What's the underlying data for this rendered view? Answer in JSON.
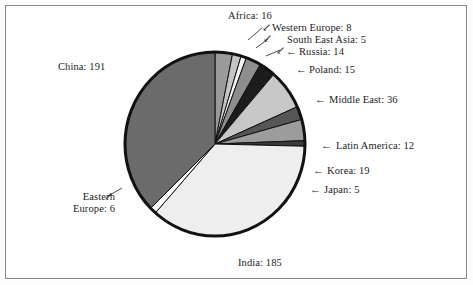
{
  "chart_data": {
    "type": "pie",
    "title": "",
    "subtitle": "",
    "xlabel": "",
    "ylabel": "",
    "legend_position": "none",
    "grid": false,
    "total": 512,
    "label_format": "name: value",
    "categories": [
      "Africa",
      "Western Europe",
      "South East Asia",
      "Russia",
      "Poland",
      "Middle East",
      "Latin America",
      "Korea",
      "Japan",
      "India",
      "Eastern Europe",
      "China"
    ],
    "values": [
      16,
      8,
      5,
      14,
      15,
      36,
      12,
      19,
      5,
      185,
      6,
      191
    ],
    "slices": [
      {
        "name": "Africa",
        "value": 16,
        "label": "Africa: 16",
        "color": "#9a9a9a",
        "start_deg": 0.0,
        "end_deg": 11.25
      },
      {
        "name": "Western Europe",
        "value": 8,
        "label": "Western Europe: 8",
        "color": "#c4c4c4",
        "start_deg": 11.25,
        "end_deg": 16.88
      },
      {
        "name": "South East Asia",
        "value": 5,
        "label": "South East Asia: 5",
        "color": "#f2f2f2",
        "start_deg": 16.88,
        "end_deg": 20.39
      },
      {
        "name": "Russia",
        "value": 14,
        "label": "Russia: 14",
        "color": "#8d8d8d",
        "start_deg": 20.39,
        "end_deg": 30.23
      },
      {
        "name": "Poland",
        "value": 15,
        "label": "Poland: 15",
        "color": "#1c1c1c",
        "start_deg": 30.23,
        "end_deg": 40.78
      },
      {
        "name": "Middle East",
        "value": 36,
        "label": "Middle East: 36",
        "color": "#c8c8c8",
        "start_deg": 40.78,
        "end_deg": 66.09
      },
      {
        "name": "Latin America",
        "value": 12,
        "label": "Latin America: 12",
        "color": "#565656",
        "start_deg": 66.09,
        "end_deg": 74.53
      },
      {
        "name": "Korea",
        "value": 19,
        "label": "Korea: 19",
        "color": "#9c9c9c",
        "start_deg": 74.53,
        "end_deg": 87.89
      },
      {
        "name": "Japan",
        "value": 5,
        "label": "Japan: 5",
        "color": "#3a3a3a",
        "start_deg": 87.89,
        "end_deg": 91.41
      },
      {
        "name": "India",
        "value": 185,
        "label": "India: 185",
        "color": "#eeeeee",
        "start_deg": 91.41,
        "end_deg": 221.48
      },
      {
        "name": "Eastern Europe",
        "value": 6,
        "label": "Eastern Europe: 6",
        "label_line1": "Eastern",
        "label_line2": "Europe: 6",
        "color": "#fafafa",
        "start_deg": 221.48,
        "end_deg": 225.7
      },
      {
        "name": "China",
        "value": 191,
        "label": "China: 191",
        "color": "#6b6b6b",
        "start_deg": 225.7,
        "end_deg": 360.0
      }
    ]
  },
  "labels": {
    "africa": "Africa: 16",
    "western_europe": "Western Europe: 8",
    "south_east_asia": "South East Asia: 5",
    "russia": "Russia: 14",
    "poland": "Poland: 15",
    "middle_east": "Middle East: 36",
    "latin_america": "Latin America: 12",
    "korea": "Korea: 19",
    "japan": "Japan: 5",
    "india": "India: 185",
    "china": "China: 191",
    "eastern_europe_line1": "Eastern",
    "eastern_europe_line2": "Europe: 6"
  },
  "arrows": {
    "africa": "↙",
    "western_europe": "↙",
    "south_east_asia": "↙",
    "russia": "←",
    "poland": "←",
    "middle_east": "←",
    "latin_america": "←",
    "korea": "←",
    "japan": "←",
    "eastern_europe": "↗"
  },
  "colors": {
    "frame_border": "#8a8a8a",
    "background": "#ffffff",
    "pie_outline": "#111111",
    "text": "#1d1d1d"
  }
}
